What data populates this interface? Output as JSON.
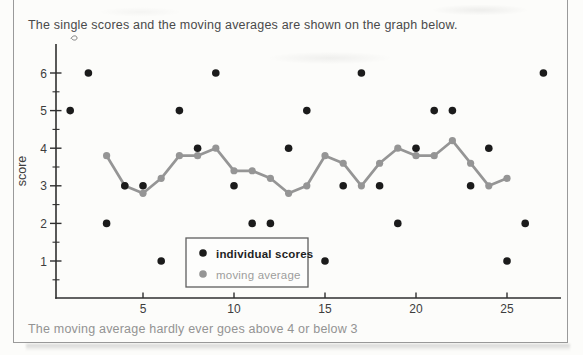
{
  "page": {
    "caption_top": "The single scores and the moving averages are shown on the graph below.",
    "caption_bottom": "The moving average hardly ever goes above 4 or below 3"
  },
  "colors": {
    "background": "#fcfcfa",
    "frame_border": "#9a9a9a",
    "caption_top_color": "#4a4a4a",
    "caption_bottom_color": "#939393",
    "axis_color": "#2f2f2f",
    "tick_label_color": "#3d3d3d",
    "individual_color": "#1b1b1b",
    "moving_avg_color": "#959595",
    "legend_border": "#5f5f5f",
    "legend_bg": "#fdfdfc",
    "legend_text_dark": "#1f1f1f",
    "legend_text_gray": "#9d9d9d"
  },
  "chart_data": {
    "type": "scatter",
    "title": "",
    "xlabel": "",
    "ylabel": "score",
    "xlim": [
      0.2,
      28
    ],
    "ylim": [
      0,
      6.8
    ],
    "x_ticks": [
      5,
      10,
      15,
      20,
      25
    ],
    "y_ticks": [
      1,
      2,
      3,
      4,
      5,
      6
    ],
    "y_minor_ticks": [
      0.5,
      1.5,
      2.5,
      3.5,
      4.5,
      5.5
    ],
    "grid": false,
    "legend_position": "inside-bottom-left",
    "series": [
      {
        "name": "individual scores",
        "style": "points",
        "x": [
          1,
          2,
          3,
          4,
          5,
          6,
          7,
          8,
          9,
          10,
          11,
          12,
          13,
          14,
          15,
          16,
          17,
          18,
          19,
          20,
          21,
          22,
          23,
          24,
          25,
          26,
          27
        ],
        "values": [
          5,
          6,
          2,
          3,
          3,
          1,
          5,
          4,
          6,
          3,
          2,
          2,
          4,
          5,
          1,
          3,
          6,
          3,
          2,
          4,
          5,
          5,
          3,
          4,
          1,
          2,
          6
        ]
      },
      {
        "name": "moving average",
        "style": "line+points",
        "window": 5,
        "x": [
          3,
          4,
          5,
          6,
          7,
          8,
          9,
          10,
          11,
          12,
          13,
          14,
          15,
          16,
          17,
          18,
          19,
          20,
          21,
          22,
          23,
          24,
          25
        ],
        "values": [
          3.8,
          3.0,
          2.8,
          3.2,
          3.8,
          3.8,
          4.0,
          3.4,
          3.4,
          3.2,
          2.8,
          3.0,
          3.8,
          3.6,
          3.0,
          3.6,
          4.0,
          3.8,
          3.8,
          4.2,
          3.6,
          3.0,
          3.2
        ]
      }
    ],
    "legend_entries": [
      {
        "label": "individual scores",
        "marker": "black-dot"
      },
      {
        "label": "moving average",
        "marker": "gray-dot"
      }
    ]
  }
}
